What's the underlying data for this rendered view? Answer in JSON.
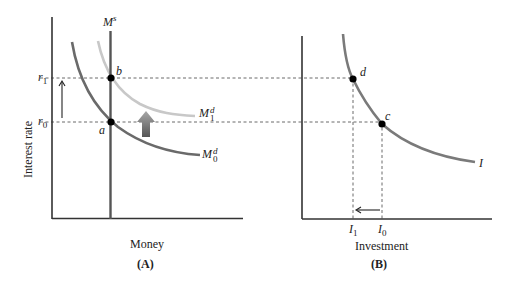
{
  "panel_a": {
    "caption": "(A)",
    "x_axis_label": "Money",
    "y_axis_label": "Interest rate",
    "money_supply": {
      "symbol": "M",
      "sup": "s"
    },
    "demand_initial": {
      "symbol": "M",
      "sup": "d",
      "sub": "0"
    },
    "demand_new": {
      "symbol": "M",
      "sup": "d",
      "sub": "1"
    },
    "rate_high": {
      "symbol": "r",
      "sub": "1"
    },
    "rate_low": {
      "symbol": "r",
      "sub": "0"
    },
    "point_a": "a",
    "point_b": "b"
  },
  "panel_b": {
    "caption": "(B)",
    "x_axis_label": "Investment",
    "curve_label": "I",
    "invest_new": {
      "symbol": "I",
      "sub": "1"
    },
    "invest_initial": {
      "symbol": "I",
      "sub": "0"
    },
    "point_c": "c",
    "point_d": "d"
  },
  "colors": {
    "axis": "#333333",
    "money_supply": "#555555",
    "demand_initial": "#6a6a6a",
    "demand_new": "#c8c8c8",
    "investment_curve": "#7a7a7a",
    "shift_arrow_top": "#a0a0a0",
    "shift_arrow_bottom": "#555555",
    "dashed": "#444444"
  }
}
